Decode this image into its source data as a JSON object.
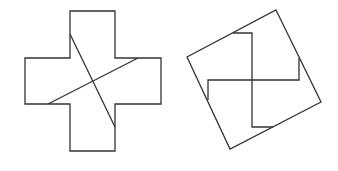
{
  "figure": {
    "stroke_color": "#333333",
    "background": "#ffffff",
    "cross": {
      "outline": "70,11 115,11 115,58 161,58 161,104 115,104 115,151 70,151 70,104 25,104 25,58 70,58",
      "cut_lines": [
        {
          "x1": 70,
          "y1": 34,
          "x2": 115,
          "y2": 127
        },
        {
          "x1": 48,
          "y1": 104,
          "x2": 138,
          "y2": 58
        }
      ]
    },
    "square": {
      "outline": "276,10 321,102 230,149 187,57",
      "pinwheel_lines": [
        "233,33 252,33 252,80",
        "252,80 299,80 299,58",
        "252,80 252,127 273,127",
        "252,80 208,80 208,100"
      ]
    }
  }
}
